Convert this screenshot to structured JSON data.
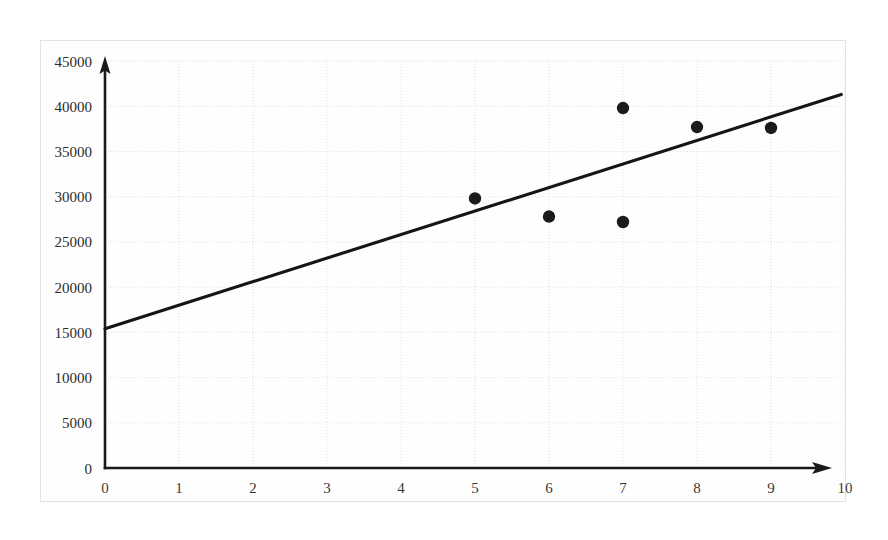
{
  "chart_data": {
    "type": "scatter",
    "title": "",
    "subtitle": "",
    "xlabel": "",
    "ylabel": "",
    "xlim": [
      0,
      10
    ],
    "ylim": [
      0,
      45000
    ],
    "grid": true,
    "legend": false,
    "legend_position": "none",
    "x_ticks": [
      "0",
      "1",
      "2",
      "3",
      "4",
      "5",
      "6",
      "7",
      "8",
      "9",
      "10"
    ],
    "x_tick_values": [
      0,
      1,
      2,
      3,
      4,
      5,
      6,
      7,
      8,
      9,
      10
    ],
    "y_ticks": [
      "0",
      "5000",
      "10000",
      "15000",
      "20000",
      "25000",
      "30000",
      "35000",
      "40000",
      "45000"
    ],
    "y_tick_values": [
      0,
      5000,
      10000,
      15000,
      20000,
      25000,
      30000,
      35000,
      40000,
      45000
    ],
    "points": [
      {
        "x": 5,
        "y": 29800
      },
      {
        "x": 6,
        "y": 27800
      },
      {
        "x": 7,
        "y": 39800
      },
      {
        "x": 7,
        "y": 27200
      },
      {
        "x": 8,
        "y": 37700
      },
      {
        "x": 9,
        "y": 37600
      }
    ],
    "series": [
      {
        "name": "data-points",
        "type": "scatter",
        "marker": "filled-circle",
        "marker_color": "#1b1b1b",
        "x": [
          5,
          6,
          7,
          7,
          8,
          9
        ],
        "values": [
          29800,
          27800,
          39800,
          27200,
          37700,
          37600
        ]
      },
      {
        "name": "trend-line",
        "type": "line",
        "color": "#151515",
        "x": [
          0,
          9.95
        ],
        "values": [
          15400,
          41300
        ],
        "intercept": 15400,
        "slope": 2600
      }
    ],
    "annotations": []
  },
  "axes": {
    "x_axis_name": "horizontal-axis",
    "y_axis_name": "vertical-axis",
    "x_arrow": true,
    "y_arrow": true
  },
  "colors": {
    "axis": "#1a1a1a",
    "grid": "#dedede",
    "marker": "#1b1b1b",
    "trend": "#151515",
    "frame": "#e3e3e3",
    "background": "#ffffff"
  }
}
